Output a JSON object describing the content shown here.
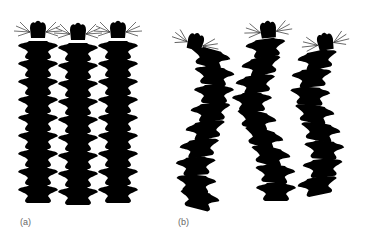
{
  "figure": {
    "panels": [
      {
        "id": "a",
        "label": "(a)",
        "description": "Three segmented worms, straight body posture, parapodia on both sides",
        "worm_count": 3
      },
      {
        "id": "b",
        "label": "(b)",
        "description": "Three segmented worms, undulating/curved body posture",
        "worm_count": 3
      }
    ],
    "colors": {
      "line": "#222222",
      "label": "#666666",
      "background": "#ffffff"
    }
  }
}
